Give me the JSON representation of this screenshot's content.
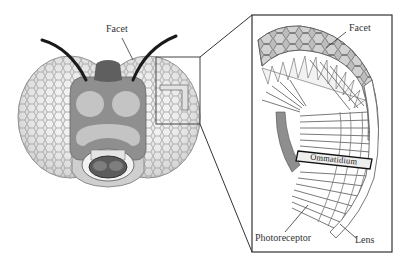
{
  "diagram": {
    "head_view": {
      "labels": {
        "facet": "Facet"
      }
    },
    "detail_view": {
      "labels": {
        "facet": "Facet",
        "ommatidium": "Ommatidium",
        "photoreceptor": "Photoreceptor",
        "lens": "Lens"
      }
    },
    "colors": {
      "background": "#ffffff",
      "eye_fill": "#e6e6e6",
      "eye_mesh": "#8a8a8a",
      "head_mid": "#8f8f8f",
      "head_dark": "#6a6a6a",
      "head_light": "#c4c4c4",
      "mouth_light": "#d8d8d8",
      "antenna": "#1a1a1a",
      "outline": "#333333",
      "detail_facet_fill": "#c9c9c9",
      "detail_inner": "#8e8e8e"
    }
  }
}
